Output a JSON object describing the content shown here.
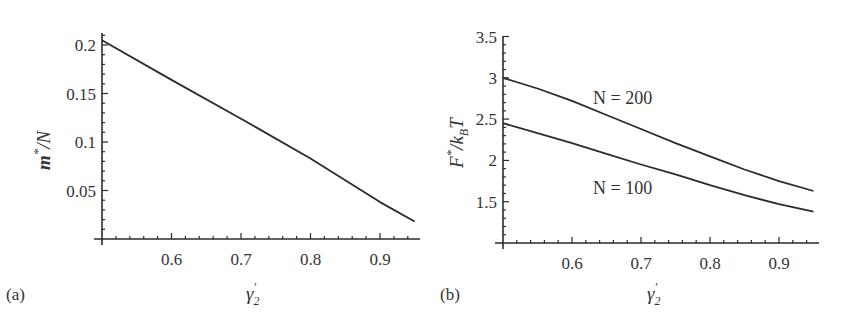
{
  "chart_data": [
    {
      "panel": "(a)",
      "type": "line",
      "title": "",
      "xlabel": "γ2'",
      "ylabel": "m*/N",
      "xlim": [
        0.5,
        0.95
      ],
      "ylim": [
        0,
        0.21
      ],
      "xticks": [
        0.6,
        0.7,
        0.8,
        0.9
      ],
      "yticks": [
        0.05,
        0.1,
        0.15,
        0.2
      ],
      "xtick_labels": [
        "0.6",
        "0.7",
        "0.8",
        "0.9"
      ],
      "ytick_labels": [
        "0.05",
        "0.1",
        "0.15",
        "0.2"
      ],
      "grid": false,
      "series": [
        {
          "name": "m*/N",
          "x": [
            0.5,
            0.6,
            0.7,
            0.8,
            0.9,
            0.95
          ],
          "y": [
            0.205,
            0.164,
            0.124,
            0.083,
            0.038,
            0.018
          ]
        }
      ]
    },
    {
      "panel": "(b)",
      "type": "line",
      "title": "",
      "xlabel": "γ2'",
      "ylabel": "F*/kBT",
      "xlim": [
        0.5,
        0.95
      ],
      "ylim": [
        1.0,
        3.5
      ],
      "xticks": [
        0.6,
        0.7,
        0.8,
        0.9
      ],
      "yticks": [
        1.5,
        2,
        2.5,
        3,
        3.5
      ],
      "xtick_labels": [
        "0.6",
        "0.7",
        "0.8",
        "0.9"
      ],
      "ytick_labels": [
        "1.5",
        "2",
        "2.5",
        "3",
        "3.5"
      ],
      "grid": false,
      "series": [
        {
          "name": "N = 200",
          "x": [
            0.5,
            0.55,
            0.6,
            0.65,
            0.7,
            0.75,
            0.8,
            0.85,
            0.9,
            0.95
          ],
          "y": [
            3.0,
            2.87,
            2.72,
            2.55,
            2.38,
            2.21,
            2.05,
            1.89,
            1.75,
            1.63
          ]
        },
        {
          "name": "N = 100",
          "x": [
            0.5,
            0.55,
            0.6,
            0.65,
            0.7,
            0.75,
            0.8,
            0.85,
            0.9,
            0.95
          ],
          "y": [
            2.45,
            2.33,
            2.21,
            2.08,
            1.95,
            1.83,
            1.7,
            1.58,
            1.47,
            1.38
          ]
        }
      ],
      "annotations": [
        "N = 200",
        "N = 100"
      ]
    }
  ],
  "panels": {
    "a": {
      "label": "(a)",
      "ylabel_main": "m",
      "ylabel_sup": "*",
      "ylabel_rest": "/N",
      "xlabel_main": "γ",
      "xlabel_sub": "2",
      "xlabel_prime": "′"
    },
    "b": {
      "label": "(b)",
      "ylabel_main": "F",
      "ylabel_sup": "*",
      "ylabel_mid": "/k",
      "ylabel_sub": "B",
      "ylabel_rest": "T",
      "xlabel_main": "γ",
      "xlabel_sub": "2",
      "xlabel_prime": "′",
      "annot_200": "N = 200",
      "annot_100": "N = 100"
    }
  },
  "colors": {
    "line": "#2b2b2b",
    "axis": "#2b2b2b",
    "text": "#333333",
    "background": "#ffffff"
  }
}
